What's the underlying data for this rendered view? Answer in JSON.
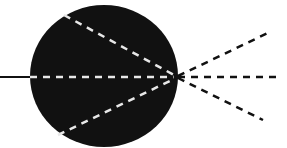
{
  "diagram": {
    "width": 287,
    "height": 148,
    "background": "#ffffff",
    "ink": "#111111",
    "inner_dash_color": "#e8e8e8",
    "lens": {
      "cx": 104,
      "cy": 76,
      "rx": 74,
      "ry": 71
    },
    "focal_point": {
      "x": 176,
      "y": 77
    },
    "incoming_line": {
      "x1": 0,
      "y1": 77,
      "x2": 30,
      "y2": 77
    },
    "inner_rays": [
      {
        "x1": 64,
        "y1": 15,
        "x2": 174,
        "y2": 75
      },
      {
        "x1": 30,
        "y1": 77,
        "x2": 174,
        "y2": 77
      },
      {
        "x1": 58,
        "y1": 135,
        "x2": 174,
        "y2": 79
      }
    ],
    "outer_rays": [
      {
        "x1": 178,
        "y1": 76,
        "x2": 270,
        "y2": 32
      },
      {
        "x1": 178,
        "y1": 77,
        "x2": 280,
        "y2": 77
      },
      {
        "x1": 178,
        "y1": 78,
        "x2": 263,
        "y2": 120
      }
    ]
  }
}
